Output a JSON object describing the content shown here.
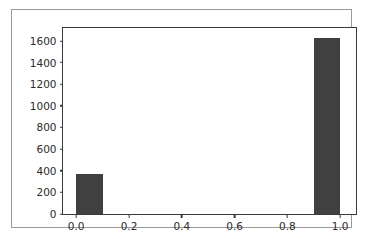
{
  "chart_data": {
    "type": "bar",
    "title": "",
    "subtitle": "",
    "xlabel": "",
    "ylabel": "",
    "grid": false,
    "legend": false,
    "legend_position": "none",
    "bar_color": "#404040",
    "background_color": "#ffffff",
    "axis_color": "#3a3a3a",
    "figure_border_color": "#9a9a9a",
    "xlim": [
      -0.05,
      1.06
    ],
    "ylim": [
      0,
      1720
    ],
    "xticks": [
      0.0,
      0.2,
      0.4,
      0.6,
      0.8,
      1.0
    ],
    "xtick_labels": [
      "0.0",
      "0.2",
      "0.4",
      "0.6",
      "0.8",
      "1.0"
    ],
    "yticks": [
      0,
      200,
      400,
      600,
      800,
      1000,
      1200,
      1400,
      1600
    ],
    "ytick_labels": [
      "0",
      "200",
      "400",
      "600",
      "800",
      "1000",
      "1200",
      "1400",
      "1600"
    ],
    "bar_width": 0.1,
    "categories": [
      "0.0",
      "1.0"
    ],
    "x": [
      0.05,
      0.95
    ],
    "values": [
      370,
      1630
    ],
    "bars": [
      {
        "label": "0.0",
        "x_left": 0.0,
        "x_right": 0.1,
        "value": 370
      },
      {
        "label": "1.0",
        "x_left": 0.9,
        "x_right": 1.0,
        "value": 1630
      }
    ],
    "annotations": []
  }
}
